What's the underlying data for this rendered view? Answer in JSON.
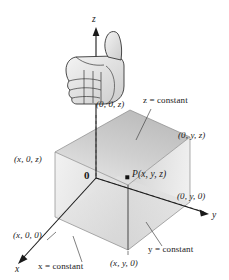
{
  "figure": {
    "background_color": "#ffffff",
    "line_color": "#1a1a1a",
    "box_colors": {
      "top_face": "#c9c9c9",
      "left_face": "#e3e3e3",
      "front_face": "#d7d7d7",
      "bottom_face": "#dedede",
      "right_face": "#cfcfcf"
    }
  },
  "axes": [
    {
      "name": "z-axis",
      "label": "z"
    },
    {
      "name": "y-axis",
      "label": "y"
    },
    {
      "name": "x-axis",
      "label": "x"
    }
  ],
  "labels": {
    "z_axis": "z",
    "y_axis": "y",
    "x_axis": "x",
    "origin": "0",
    "point_P": "P(x, y, z)",
    "vertex_00z": "(0, 0, z)",
    "vertex_0yz": "(0, y, z)",
    "vertex_x0z": "(x, 0, z)",
    "vertex_0y0": "(0, y, 0)",
    "vertex_x00": "(x, 0, 0)",
    "vertex_xy0": "(x, y, 0)",
    "plane_z_constant": "z = constant",
    "plane_y_constant": "y = constant",
    "plane_x_constant": "x = constant"
  },
  "hand": {
    "name": "thumbs-up-hand",
    "description": "right-hand rule thumbs up illustration"
  }
}
